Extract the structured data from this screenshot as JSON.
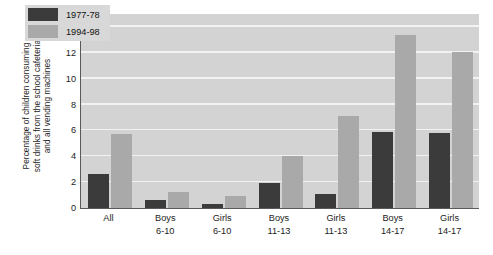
{
  "chart_data": {
    "type": "bar",
    "title": "",
    "xlabel": "",
    "ylabel": "Percentage of children consuming soft drinks from the school cafeteria and all vending machines",
    "ylabel_lines": [
      "Percentage of children consuming",
      "soft drinks from the school cafeteria",
      "and all vending machines"
    ],
    "categories": [
      "All",
      "Boys 6-10",
      "Girls 6-10",
      "Boys 11-13",
      "Girls 11-13",
      "Boys 14-17",
      "Girls 14-17"
    ],
    "category_lines": [
      [
        "All",
        ""
      ],
      [
        "Boys",
        "6-10"
      ],
      [
        "Girls",
        "6-10"
      ],
      [
        "Boys",
        "11-13"
      ],
      [
        "Girls",
        "11-13"
      ],
      [
        "Boys",
        "14-17"
      ],
      [
        "Girls",
        "14-17"
      ]
    ],
    "series": [
      {
        "name": "1977-78",
        "color": "#3b3b3b",
        "values": [
          2.6,
          0.6,
          0.3,
          1.9,
          1.1,
          5.9,
          5.8
        ]
      },
      {
        "name": "1994-98",
        "color": "#a9a9a9",
        "values": [
          5.7,
          1.2,
          0.9,
          4.0,
          7.1,
          13.4,
          12.1
        ]
      }
    ],
    "ylim": [
      0,
      15
    ],
    "yticks": [
      0,
      2,
      4,
      6,
      8,
      10,
      12,
      14
    ],
    "ytick_labels": [
      "0",
      "2",
      "4",
      "6",
      "8",
      "10",
      "12",
      "14"
    ],
    "grid": true,
    "grid_color": "#f2f2f2",
    "legend_position": "top-left",
    "plot_background": "#d3d3d3",
    "figure_background": "#ffffff"
  },
  "legend": {
    "items": [
      {
        "label": "1977-78"
      },
      {
        "label": "1994-98"
      }
    ]
  }
}
